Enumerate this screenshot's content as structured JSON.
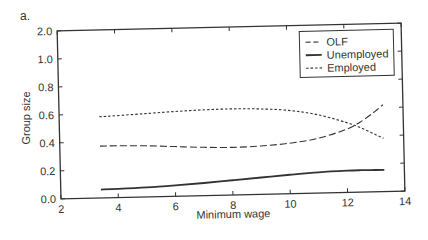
{
  "panel_label": "a.",
  "chart_data": {
    "type": "line",
    "title": "",
    "xlabel": "Minimum wage",
    "ylabel": "Group size",
    "xlim": [
      2,
      14
    ],
    "ylim": [
      0,
      2.0
    ],
    "xticks": [
      2,
      4,
      6,
      8,
      10,
      12,
      14
    ],
    "yticks": [
      "0.0",
      "0.2",
      "0.4",
      "0.6",
      "0.8",
      "1.0",
      "2.0"
    ],
    "y_axis_note": "broken axis: 1.0 to 2.0 spans same interval as 0.2 steps",
    "grid": false,
    "legend_position": "upper right",
    "x": [
      3.4,
      4,
      5,
      6,
      7,
      8,
      9,
      10,
      11,
      12,
      12.5,
      13,
      13.3
    ],
    "series": [
      {
        "name": "OLF",
        "style": "dashed",
        "values": [
          0.37,
          0.37,
          0.365,
          0.355,
          0.345,
          0.34,
          0.345,
          0.36,
          0.39,
          0.45,
          0.5,
          0.57,
          0.62
        ]
      },
      {
        "name": "Unemployed",
        "style": "solid",
        "values": [
          0.06,
          0.062,
          0.068,
          0.078,
          0.09,
          0.105,
          0.12,
          0.135,
          0.148,
          0.155,
          0.156,
          0.155,
          0.155
        ]
      },
      {
        "name": "Employed",
        "style": "dotted",
        "values": [
          0.58,
          0.585,
          0.595,
          0.605,
          0.612,
          0.615,
          0.61,
          0.595,
          0.56,
          0.5,
          0.46,
          0.41,
          0.38
        ]
      }
    ],
    "colors": {
      "line": "#333333",
      "axis": "#333333"
    }
  }
}
